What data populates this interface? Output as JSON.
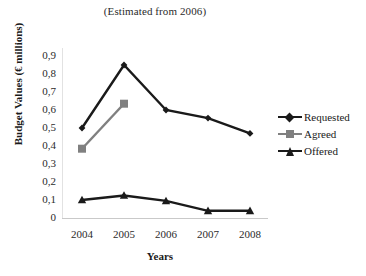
{
  "chart_data": {
    "type": "line",
    "title": "(Estimated from 2006)",
    "xlabel": "Years",
    "ylabel": "Budget Values (€ millions)",
    "categories": [
      "2004",
      "2005",
      "2006",
      "2007",
      "2008"
    ],
    "ytick_labels": [
      "0,9",
      "0,8",
      "0,7",
      "0,6",
      "0,5",
      "0,4",
      "0,3",
      "0,2",
      "0,1",
      "0"
    ],
    "ytick_values": [
      0.9,
      0.8,
      0.7,
      0.6,
      0.5,
      0.4,
      0.3,
      0.2,
      0.1,
      0
    ],
    "ylim": [
      0,
      0.9
    ],
    "grid": false,
    "legend_position": "right",
    "decimal_separator": ",",
    "series": [
      {
        "name": "Requested",
        "marker": "diamond",
        "color": "#1a1a1a",
        "x": [
          "2004",
          "2005",
          "2006",
          "2007",
          "2008"
        ],
        "values": [
          0.5,
          0.85,
          0.6,
          0.555,
          0.47
        ]
      },
      {
        "name": "Agreed",
        "marker": "square",
        "color": "#808080",
        "x": [
          "2004",
          "2005"
        ],
        "values": [
          0.385,
          0.635
        ]
      },
      {
        "name": "Offered",
        "marker": "triangle",
        "color": "#1a1a1a",
        "x": [
          "2004",
          "2005",
          "2006",
          "2007",
          "2008"
        ],
        "values": [
          0.1,
          0.125,
          0.095,
          0.04,
          0.04
        ]
      }
    ]
  },
  "legend": {
    "entries": [
      {
        "label": "Requested"
      },
      {
        "label": "Agreed"
      },
      {
        "label": "Offered"
      }
    ]
  },
  "axes": {
    "baseline_color": "#c9c9c9"
  }
}
